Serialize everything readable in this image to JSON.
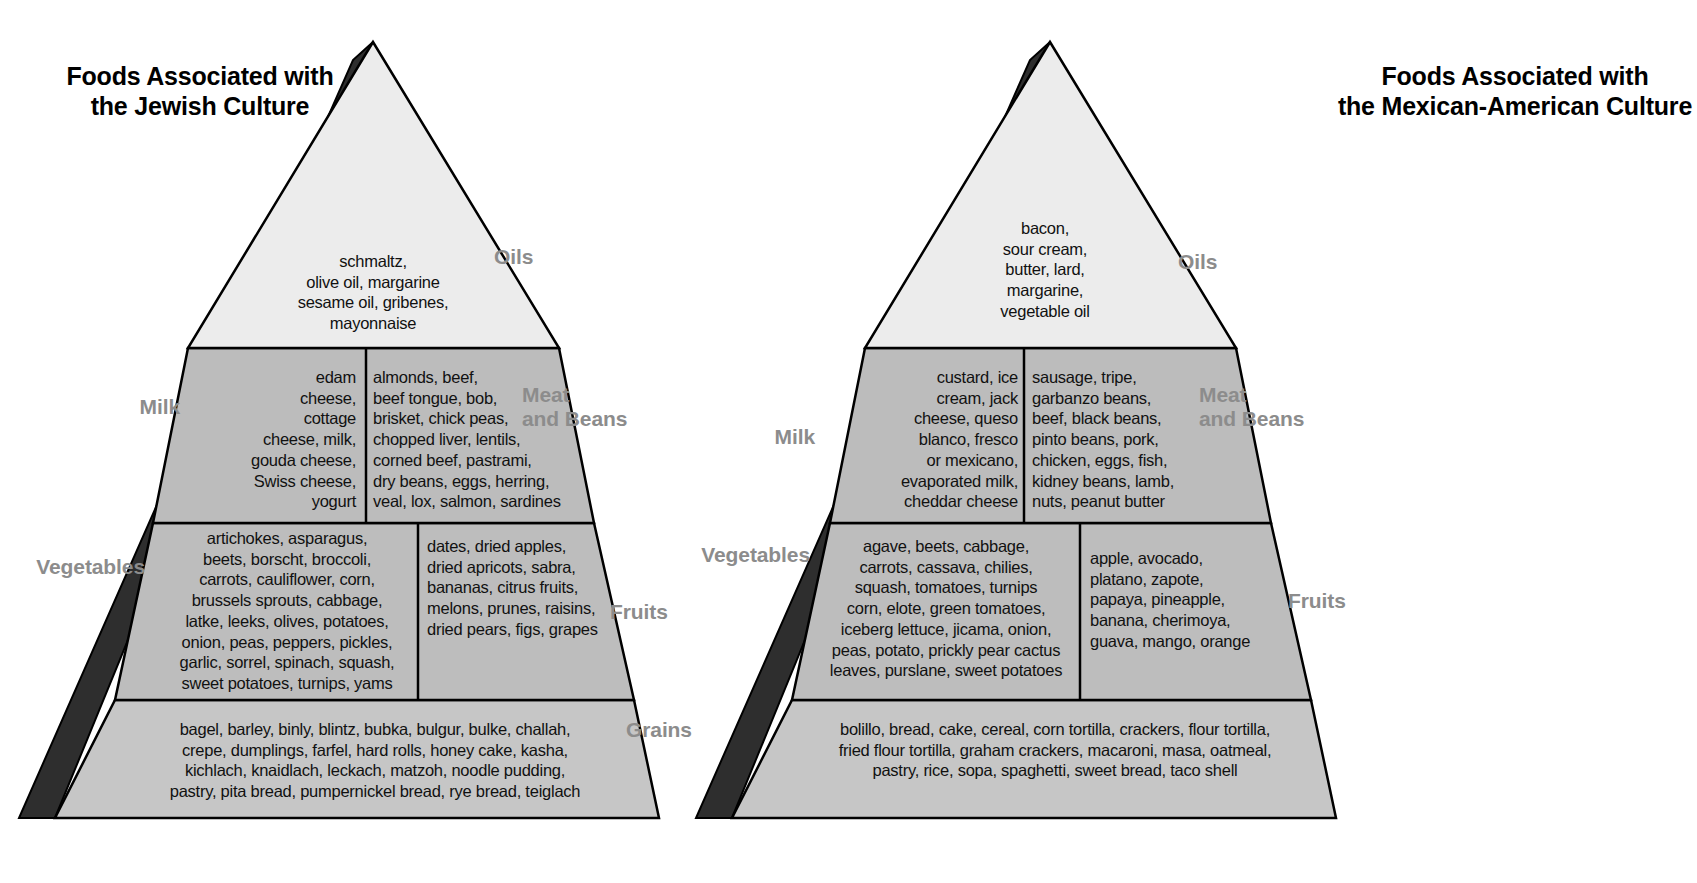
{
  "page": {
    "background": "#ffffff",
    "label_color": "#8c8c8c",
    "text_color": "#111111",
    "tier_colors": {
      "oils": "#ececec",
      "milk_meat": "#bcbcbc",
      "veg_fruit": "#bdbdbd",
      "grains": "#c6c6c6",
      "shadow_edge": "#333333",
      "outline": "#000000"
    }
  },
  "shared": {
    "grains_label": "Grains"
  },
  "pyramids": [
    {
      "id": "jewish",
      "title": "Foods Associated with\nthe Jewish Culture",
      "tiers": [
        {
          "id": "oils",
          "label": "Oils",
          "foods": "schmaltz,\nolive oil, margarine\nsesame oil, gribenes,\nmayonnaise"
        },
        {
          "id": "milk",
          "label": "Milk",
          "foods": "edam\ncheese,\ncottage\ncheese, milk,\ngouda cheese,\nSwiss cheese,\nyogurt"
        },
        {
          "id": "meat-and-beans",
          "label": "Meat\nand Beans",
          "foods": "almonds, beef,\nbeef tongue, bob,\nbrisket, chick peas,\nchopped liver, lentils,\ncorned beef, pastrami,\ndry beans, eggs, herring,\nveal, lox, salmon, sardines"
        },
        {
          "id": "vegetables",
          "label": "Vegetables",
          "foods": "artichokes, asparagus,\nbeets, borscht, broccoli,\ncarrots, cauliflower, corn,\nbrussels sprouts, cabbage,\nlatke, leeks, olives, potatoes,\nonion, peas, peppers, pickles,\ngarlic, sorrel, spinach, squash,\nsweet potatoes, turnips, yams"
        },
        {
          "id": "fruits",
          "label": "Fruits",
          "foods": "dates, dried apples,\ndried apricots, sabra,\nbananas, citrus fruits,\nmelons, prunes, raisins,\ndried pears, figs, grapes"
        },
        {
          "id": "grains",
          "label": "Grains",
          "foods": "bagel, barley, binly, blintz, bubka, bulgur, bulke, challah,\ncrepe, dumplings, farfel, hard rolls, honey cake, kasha,\nkichlach, knaidlach, leckach, matzoh, noodle pudding,\npastry, pita bread, pumpernickel bread, rye bread, teiglach"
        }
      ]
    },
    {
      "id": "mexican-american",
      "title": "Foods Associated with\nthe Mexican-American Culture",
      "tiers": [
        {
          "id": "oils",
          "label": "Oils",
          "foods": "bacon,\nsour cream,\nbutter, lard,\nmargarine,\nvegetable oil"
        },
        {
          "id": "milk",
          "label": "Milk",
          "foods": "custard, ice\ncream, jack\ncheese, queso\nblanco, fresco\nor mexicano,\nevaporated milk,\ncheddar cheese"
        },
        {
          "id": "meat-and-beans",
          "label": "Meat\nand Beans",
          "foods": "sausage, tripe,\ngarbanzo beans,\nbeef, black beans,\npinto beans, pork,\nchicken, eggs, fish,\nkidney beans, lamb,\nnuts, peanut butter"
        },
        {
          "id": "vegetables",
          "label": "Vegetables",
          "foods": "agave, beets, cabbage,\ncarrots, cassava, chilies,\nsquash, tomatoes, turnips\ncorn, elote, green tomatoes,\niceberg lettuce, jicama, onion,\npeas, potato, prickly pear cactus\nleaves, purslane, sweet potatoes"
        },
        {
          "id": "fruits",
          "label": "Fruits",
          "foods": "apple, avocado,\nplatano, zapote,\npapaya, pineapple,\nbanana, cherimoya,\nguava, mango, orange"
        },
        {
          "id": "grains",
          "label": "Grains",
          "foods": "bolillo, bread, cake, cereal, corn tortilla, crackers, flour tortilla,\nfried flour tortilla, graham crackers, macaroni, masa, oatmeal,\npastry, rice, sopa, spaghetti, sweet bread, taco shell"
        }
      ]
    }
  ]
}
